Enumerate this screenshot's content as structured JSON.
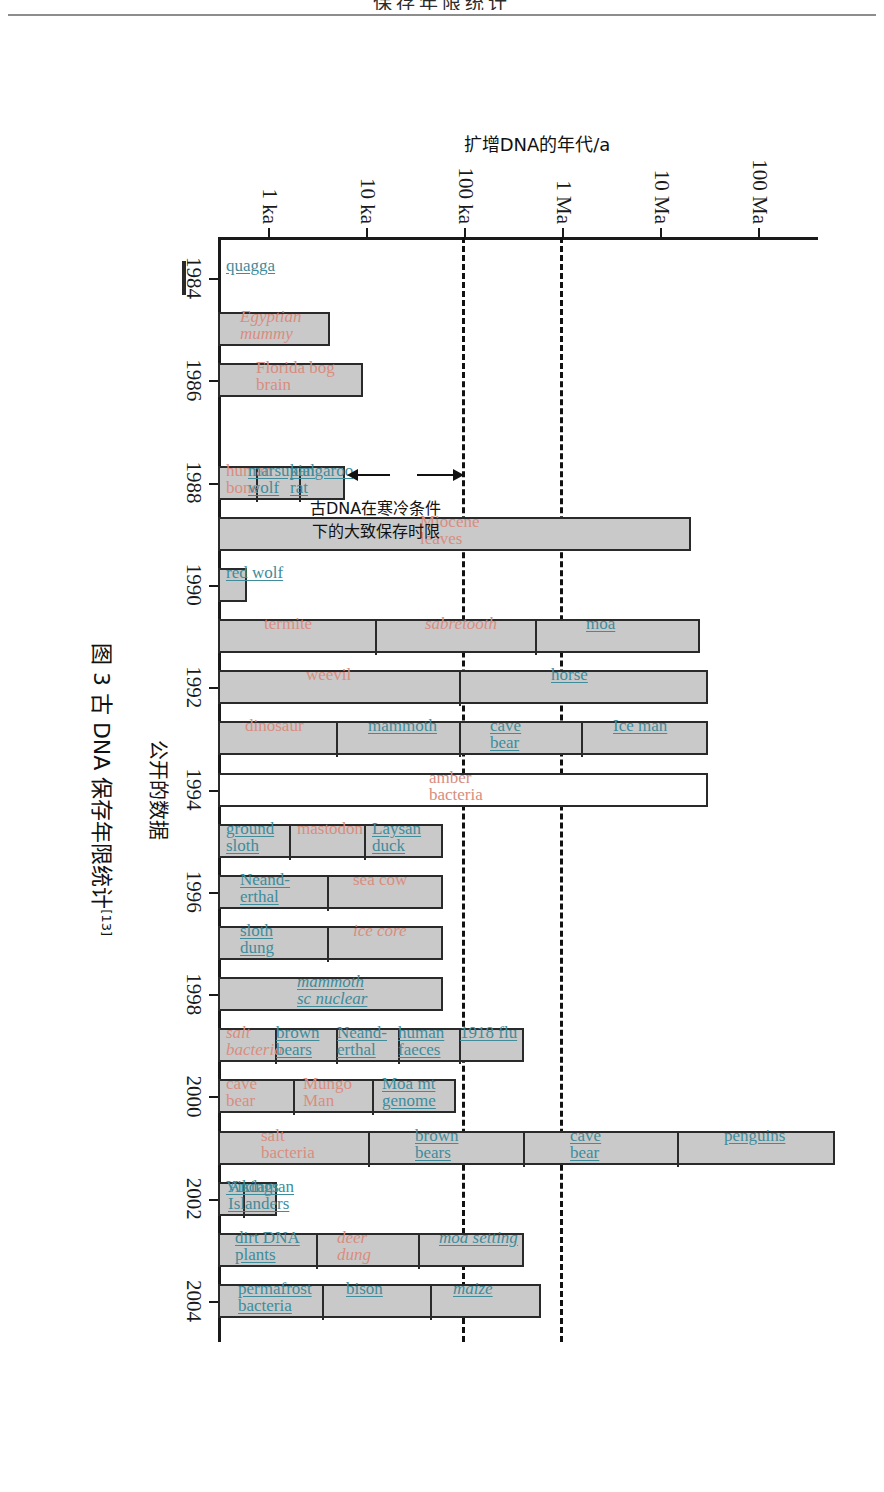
{
  "page": {
    "top_cropped_heading": "保存年限统计",
    "figure_caption": "图 3  古 DNA 保存年限统计",
    "caption_ref": "[13]"
  },
  "annotation": {
    "text_line1": "古DNA在寒冷条件",
    "text_line2": "下的大致保存时限"
  },
  "chart_data": {
    "type": "bar",
    "title": "图 3  古 DNA 保存年限统计",
    "xlabel": "公开的数据",
    "ylabel": "扩增DNA的年代/a",
    "grid": false,
    "legend": null,
    "y_scale": "log",
    "y_tick_labels": [
      "100 Ma",
      "10 Ma",
      "1 Ma",
      "100 ka",
      "10 ka",
      "1 ka"
    ],
    "y_tick_values": [
      100000000,
      10000000,
      1000000,
      100000,
      10000,
      1000
    ],
    "ylim": [
      300,
      400000000
    ],
    "x_tick_labels": [
      "1984",
      "1986",
      "1988",
      "1990",
      "1992",
      "1994",
      "1996",
      "1998",
      "2000",
      "2002",
      "2004"
    ],
    "xlim": [
      1983.2,
      2004.8
    ],
    "reference_lines": [
      {
        "label": "1 Ma limit",
        "value": 1000000
      },
      {
        "label": "100 ka limit",
        "value": 100000
      }
    ],
    "note": "Each horizontal bar spans from the chart baseline up to the claimed age of amplified DNA; tick marks inside bars separate individually labelled claims for that year.",
    "bars": [
      {
        "year": "1984",
        "top_value": 140,
        "labels": [
          {
            "text": "quagga",
            "color": "teal"
          }
        ]
      },
      {
        "year": "1985",
        "top_value": 4200,
        "labels": [
          {
            "text": "Egyptian\nmummy",
            "color": "salmon-italic"
          }
        ]
      },
      {
        "year": "1986",
        "top_value": 9000,
        "labels": [
          {
            "text": "Florida bog\nbrain",
            "color": "salmon"
          }
        ]
      },
      {
        "year": "1988",
        "top_value": 6000,
        "labels": [
          {
            "text": "human\nbone",
            "color": "salmon"
          },
          {
            "text": "marsupial\nwolf",
            "color": "teal"
          },
          {
            "text": "kangaroo\nrat",
            "color": "teal"
          }
        ]
      },
      {
        "year": "1989",
        "top_value": 20000000,
        "labels": [
          {
            "text": "Miocene\nleaves",
            "color": "salmon"
          }
        ]
      },
      {
        "year": "1990",
        "top_value": 600,
        "labels": [
          {
            "text": "red wolf",
            "color": "teal"
          }
        ]
      },
      {
        "year": "1991",
        "top_value": 25000000,
        "labels": [
          {
            "text": "termite",
            "color": "salmon"
          },
          {
            "text": "sabretooth",
            "color": "salmon-italic"
          },
          {
            "text": "moa",
            "color": "teal"
          }
        ]
      },
      {
        "year": "1992",
        "top_value": 30000000,
        "labels": [
          {
            "text": "weevil",
            "color": "salmon"
          },
          {
            "text": "horse",
            "color": "teal"
          }
        ]
      },
      {
        "year": "1993",
        "top_value": 30000000,
        "labels": [
          {
            "text": "dinosaur",
            "color": "salmon"
          },
          {
            "text": "mammoth",
            "color": "teal"
          },
          {
            "text": "cave\nbear",
            "color": "teal"
          },
          {
            "text": "Ice man",
            "color": "teal"
          }
        ]
      },
      {
        "year": "1994",
        "top_value": 30000000,
        "open": true,
        "labels": [
          {
            "text": "amber\nbacteria",
            "color": "salmon"
          }
        ]
      },
      {
        "year": "1995",
        "top_value": 60000,
        "labels": [
          {
            "text": "ground\nsloth",
            "color": "teal"
          },
          {
            "text": "mastodon",
            "color": "salmon"
          },
          {
            "text": "Laysan\nduck",
            "color": "teal"
          }
        ]
      },
      {
        "year": "1996",
        "top_value": 60000,
        "labels": [
          {
            "text": "Neand-\nerthal",
            "color": "teal"
          },
          {
            "text": "sea cow",
            "color": "salmon"
          }
        ]
      },
      {
        "year": "1997",
        "top_value": 60000,
        "labels": [
          {
            "text": "sloth\ndung",
            "color": "teal"
          },
          {
            "text": "ice core",
            "color": "salmon-italic"
          }
        ]
      },
      {
        "year": "1998",
        "top_value": 60000,
        "labels": [
          {
            "text": "mammoth\nsc nuclear",
            "color": "teal-italic"
          }
        ]
      },
      {
        "year": "1999",
        "top_value": 400000,
        "labels": [
          {
            "text": "salt\nbacteria",
            "color": "salmon-italic"
          },
          {
            "text": "brown\nbears",
            "color": "teal"
          },
          {
            "text": "Neand-\nerthal",
            "color": "teal"
          },
          {
            "text": "human\nfaeces",
            "color": "teal"
          },
          {
            "text": "1918 flu",
            "color": "teal"
          }
        ]
      },
      {
        "year": "2000",
        "top_value": 80000,
        "labels": [
          {
            "text": "cave\nbear",
            "color": "salmon"
          },
          {
            "text": "Mungo\nMan",
            "color": "salmon"
          },
          {
            "text": "Moa mt\ngenome",
            "color": "teal"
          }
        ]
      },
      {
        "year": "2001",
        "top_value": 600000000,
        "labels": [
          {
            "text": "salt\nbacteria",
            "color": "salmon"
          },
          {
            "text": "brown\nbears",
            "color": "teal"
          },
          {
            "text": "cave\nbear",
            "color": "teal"
          },
          {
            "text": "penguins",
            "color": "teal"
          }
        ]
      },
      {
        "year": "2002",
        "top_value": 1200,
        "labels": [
          {
            "text": "Vikings",
            "color": "teal"
          },
          {
            "text": "Andaman\nIslanders",
            "color": "teal"
          }
        ]
      },
      {
        "year": "2003",
        "top_value": 400000,
        "labels": [
          {
            "text": "dirt DNA\nplants",
            "color": "teal"
          },
          {
            "text": "deer\ndung",
            "color": "salmon-italic"
          },
          {
            "text": "moa setting",
            "color": "teal-italic"
          }
        ]
      },
      {
        "year": "2004",
        "top_value": 600000,
        "labels": [
          {
            "text": "permafrost\nbacteria",
            "color": "teal"
          },
          {
            "text": "bison",
            "color": "teal"
          },
          {
            "text": "maize",
            "color": "teal-italic"
          }
        ]
      }
    ]
  }
}
